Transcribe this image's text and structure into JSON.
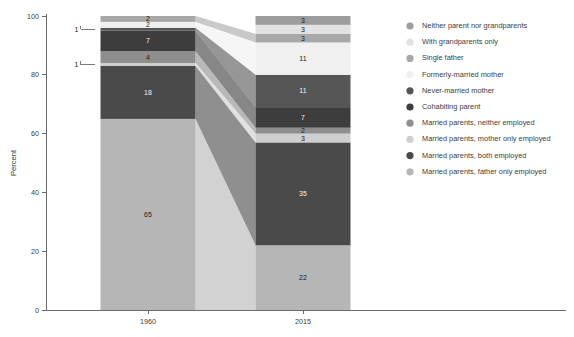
{
  "chart_data": {
    "type": "bar",
    "subtype": "stacked-bar-alluvial",
    "title": "",
    "xlabel": "",
    "ylabel": "Percent",
    "categories": [
      "1960",
      "2015"
    ],
    "ylim": [
      0,
      100
    ],
    "yticks": [
      0,
      20,
      40,
      60,
      80,
      100
    ],
    "grid": false,
    "legend_position": "right",
    "stack_order": "bottom-to-top",
    "series": [
      {
        "name": "Married parents, father only employed",
        "color": "#b6b6b6",
        "values": [
          65,
          22
        ]
      },
      {
        "name": "Married parents, both employed",
        "color": "#4a4a4a",
        "values": [
          18,
          35
        ]
      },
      {
        "name": "Married parents, mother only employed",
        "color": "#cfcfcf",
        "values": [
          1,
          3
        ]
      },
      {
        "name": "Married parents, neither employed",
        "color": "#8e8e8e",
        "values": [
          4,
          2
        ]
      },
      {
        "name": "Cohabiting parent",
        "color": "#3d3d3d",
        "values": [
          7,
          7
        ]
      },
      {
        "name": "Never-married mother",
        "color": "#565656",
        "values": [
          1,
          11
        ]
      },
      {
        "name": "Formerly-married mother",
        "color": "#f0f0f0",
        "values": [
          2,
          11
        ]
      },
      {
        "name": "Single father",
        "color": "#a8a8a8",
        "values": [
          2,
          3
        ]
      },
      {
        "name": "With grandparents only",
        "color": "#e2e2e2",
        "values": [
          0,
          3
        ]
      },
      {
        "name": "Neither parent nor grandparents",
        "color": "#9d9d9d",
        "values": [
          0,
          3
        ]
      }
    ],
    "legend_entries": [
      {
        "label": "Neither parent nor grandparents",
        "color": "#9d9d9d"
      },
      {
        "label": "With grandparents only",
        "color": "#e2e2e2"
      },
      {
        "label": "Single father",
        "color": "#a8a8a8"
      },
      {
        "label": "Formerly-married mother",
        "color": "#f0f0f0"
      },
      {
        "label": "Never-married mother",
        "color": "#565656"
      },
      {
        "label": "Cohabiting parent",
        "color": "#3d3d3d"
      },
      {
        "label": "Married parents, neither employed",
        "color": "#8e8e8e"
      },
      {
        "label": "Married parents, mother only employed",
        "color": "#cfcfcf"
      },
      {
        "label": "Married parents, both employed",
        "color": "#4a4a4a"
      },
      {
        "label": "Married parents, father only employed",
        "color": "#b6b6b6"
      }
    ],
    "bars": [
      {
        "category": "1960",
        "segments": [
          {
            "label": "Married parents, father only employed",
            "value": 65,
            "data_label": "65",
            "label_placement": "inside"
          },
          {
            "label": "Married parents, both employed",
            "value": 18,
            "data_label": "18",
            "label_placement": "inside"
          },
          {
            "label": "Married parents, mother only employed",
            "value": 1,
            "data_label": "1",
            "label_placement": "callout"
          },
          {
            "label": "Married parents, neither employed",
            "value": 4,
            "data_label": "4",
            "label_placement": "inside"
          },
          {
            "label": "Cohabiting parent",
            "value": 7,
            "data_label": "7",
            "label_placement": "inside"
          },
          {
            "label": "Never-married mother",
            "value": 1,
            "data_label": "1",
            "label_placement": "callout"
          },
          {
            "label": "Formerly-married mother",
            "value": 2,
            "data_label": "2",
            "label_placement": "inside"
          },
          {
            "label": "Single father",
            "value": 2,
            "data_label": "2",
            "label_placement": "inside"
          }
        ]
      },
      {
        "category": "2015",
        "segments": [
          {
            "label": "Married parents, father only employed",
            "value": 22,
            "data_label": "22",
            "label_placement": "inside"
          },
          {
            "label": "Married parents, both employed",
            "value": 35,
            "data_label": "35",
            "label_placement": "inside"
          },
          {
            "label": "Married parents, mother only employed",
            "value": 3,
            "data_label": "3",
            "label_placement": "inside"
          },
          {
            "label": "Married parents, neither employed",
            "value": 2,
            "data_label": "2",
            "label_placement": "inside"
          },
          {
            "label": "Cohabiting parent",
            "value": 7,
            "data_label": "7",
            "label_placement": "inside"
          },
          {
            "label": "Never-married mother",
            "value": 11,
            "data_label": "11",
            "label_placement": "inside"
          },
          {
            "label": "Formerly-married mother",
            "value": 11,
            "data_label": "11",
            "label_placement": "inside"
          },
          {
            "label": "Single father",
            "value": 3,
            "data_label": "3",
            "label_placement": "inside"
          },
          {
            "label": "With grandparents only",
            "value": 3,
            "data_label": "3",
            "label_placement": "inside"
          },
          {
            "label": "Neither parent nor grandparents",
            "value": 3,
            "data_label": "3",
            "label_placement": "inside"
          }
        ]
      }
    ]
  }
}
